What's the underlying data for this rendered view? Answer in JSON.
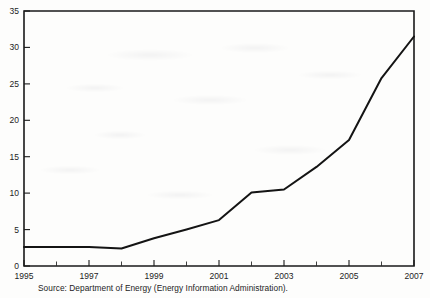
{
  "chart_data": {
    "type": "line",
    "title": "",
    "subtitle": "",
    "xlabel": "",
    "ylabel": "",
    "x": [
      1995,
      1996,
      1997,
      1998,
      1999,
      2000,
      2001,
      2002,
      2003,
      2004,
      2005,
      2006,
      2007
    ],
    "series": [
      {
        "name": "",
        "values": [
          2.6,
          2.6,
          2.6,
          2.4,
          3.8,
          5.0,
          6.3,
          10.1,
          10.5,
          13.6,
          17.3,
          25.8,
          31.5
        ]
      }
    ],
    "xlim": [
      1995,
      2007
    ],
    "ylim": [
      0,
      35
    ],
    "yticks": [
      0,
      5,
      10,
      15,
      20,
      25,
      30,
      35
    ],
    "ytick_labels": [
      "0",
      "5",
      "10",
      "15",
      "20",
      "25",
      "30",
      "35"
    ],
    "xticks": [
      1995,
      1997,
      1999,
      2001,
      2003,
      2005,
      2007
    ],
    "xtick_labels": [
      "1995",
      "1997",
      "1999",
      "2001",
      "2003",
      "2005",
      "2007"
    ],
    "x_minor_ticks": [
      1996,
      1998,
      2000,
      2002,
      2004,
      2006
    ],
    "grid": false,
    "legend": false,
    "legend_position": "none",
    "line_color": "#141414",
    "axis_color": "#1a1a1a",
    "background_color": "#fdfdfc"
  },
  "caption": {
    "source_note": "Source: Department of Energy (Energy Information Administration)."
  }
}
